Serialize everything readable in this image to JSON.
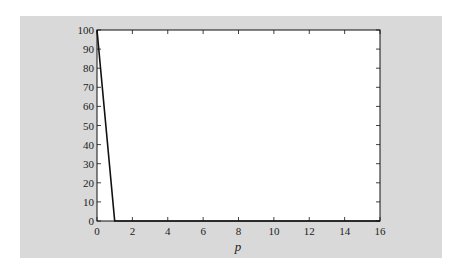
{
  "chart_data": {
    "type": "line",
    "title": "",
    "xlabel": "p",
    "ylabel": "",
    "xlim": [
      0,
      16
    ],
    "ylim": [
      0,
      100
    ],
    "x_ticks": [
      0,
      2,
      4,
      6,
      8,
      10,
      12,
      14,
      16
    ],
    "y_ticks": [
      0,
      10,
      20,
      30,
      40,
      50,
      60,
      70,
      80,
      90,
      100
    ],
    "grid": false,
    "legend": null,
    "series": [
      {
        "name": "series-1",
        "x": [
          0,
          1,
          16
        ],
        "y": [
          100,
          0,
          0
        ],
        "color": "#111111"
      }
    ]
  },
  "colors": {
    "background": "#d9d9d9",
    "plot_area": "#ffffff",
    "line": "#111111"
  }
}
